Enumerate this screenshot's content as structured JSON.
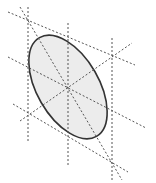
{
  "diagram": {
    "colors": {
      "background": "#ffffff",
      "ellipse_fill": "#ececec",
      "ellipse_stroke": "#333333",
      "dashed_lines": "#555555"
    },
    "ellipse": {
      "cx": 68,
      "cy": 87,
      "rx": 31,
      "ry": 57,
      "rotation_deg": -30
    },
    "vertical_lines": [
      {
        "name": "left-vertical-tangent",
        "x": 28,
        "y1": 7,
        "y2": 141
      },
      {
        "name": "center-vertical-diameter",
        "x": 68,
        "y1": 23,
        "y2": 167
      },
      {
        "name": "right-vertical-tangent",
        "x": 112,
        "y1": 38,
        "y2": 182
      }
    ],
    "slanted_lines": [
      {
        "name": "upper-tangent",
        "x1": 8,
        "y1": 12,
        "x2": 135,
        "y2": 65
      },
      {
        "name": "lower-tangent",
        "x1": 13,
        "y1": 104,
        "x2": 128,
        "y2": 172
      },
      {
        "name": "conjugate-diameter",
        "x1": 8,
        "y1": 57,
        "x2": 146,
        "y2": 128
      },
      {
        "name": "minor-axis",
        "x1": 20,
        "y1": 121,
        "x2": 132,
        "y2": 43
      },
      {
        "name": "major-axis",
        "x1": 20,
        "y1": 7,
        "x2": 122,
        "y2": 180
      }
    ],
    "center_point": {
      "x": 68,
      "y": 87
    }
  }
}
